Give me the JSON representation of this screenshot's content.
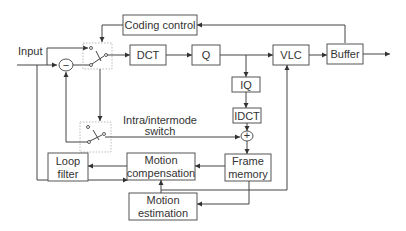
{
  "diagram": {
    "blocks": {
      "coding_control": "Coding control",
      "dct": "DCT",
      "q": "Q",
      "vlc": "VLC",
      "buffer": "Buffer",
      "iq": "IQ",
      "idct": "IDCT",
      "loop_filter_1": "Loop",
      "loop_filter_2": "filter",
      "motion_comp_1": "Motion",
      "motion_comp_2": "compensation",
      "frame_memory_1": "Frame",
      "frame_memory_2": "memory",
      "motion_est_1": "Motion",
      "motion_est_2": "estimation"
    },
    "labels": {
      "input": "Input",
      "switch_1": "Intra/intermode",
      "switch_2": "switch",
      "subtract": "−",
      "add": "+"
    },
    "colors": {
      "line": "#444444",
      "box_border": "#555555",
      "text": "#333333"
    }
  }
}
